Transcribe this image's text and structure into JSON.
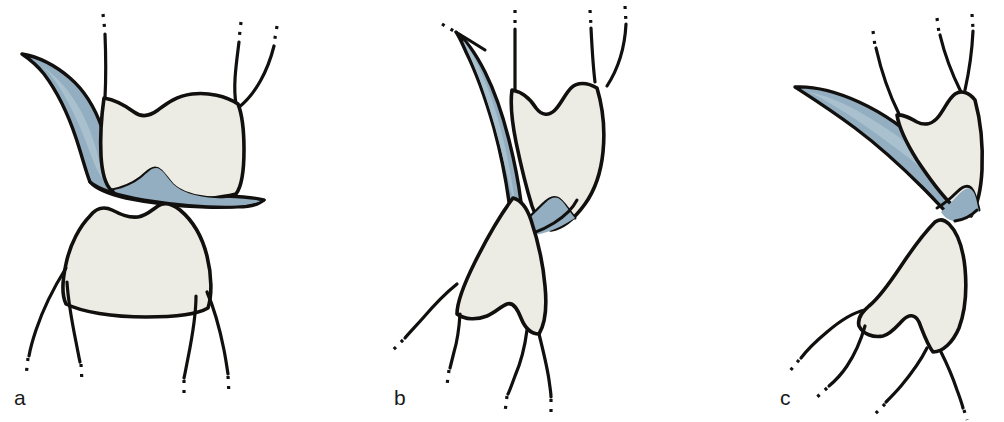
{
  "figure": {
    "background_color": "#ffffff",
    "width": 1004,
    "height": 422,
    "panel_count": 3
  },
  "palette": {
    "outline": "#12100e",
    "enamel_fill": "#ecebe4",
    "blue_fill": "#93aec0",
    "blue_fill_light": "#a9c0ce",
    "background": "#ffffff"
  },
  "panels": [
    {
      "id": "a",
      "label": "a",
      "description": "Upper and lower molar crowns separated, blue wedge entering from upper left and spreading across the occlusal surface of the upper molar",
      "upper_root_count": 4,
      "lower_root_count": 4,
      "blue_shape_name": "blue-wedge"
    },
    {
      "id": "b",
      "label": "b",
      "description": "Teeth rotated, blue wedge descends steeply along the mesial surface of the upper molar to the occlusal contact",
      "upper_root_count": 4,
      "lower_root_count": 4,
      "blue_shape_name": "blue-wedge"
    },
    {
      "id": "c",
      "label": "c",
      "description": "Teeth rotated further, blue wedge lies nearly horizontally across the upper molar crown",
      "upper_root_count": 3,
      "lower_root_count": 4,
      "blue_shape_name": "blue-wedge"
    }
  ]
}
